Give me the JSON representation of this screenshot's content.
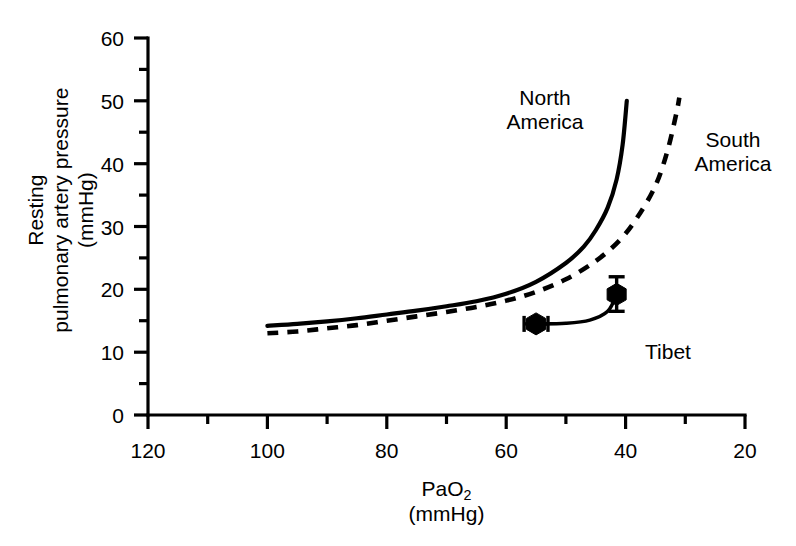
{
  "chart_data": {
    "type": "line",
    "title": "",
    "xlabel": "PaO2 (mmHg)",
    "ylabel": "Resting pulmonary artery pressure (mmHg)",
    "xlim": [
      120,
      20
    ],
    "ylim": [
      0,
      60
    ],
    "x_axis_reversed": true,
    "grid": false,
    "legend_position": "inline-annotations",
    "xticks": [
      120,
      100,
      80,
      60,
      40,
      20
    ],
    "xticks_minor": [
      110,
      90,
      70,
      50,
      30
    ],
    "yticks": [
      0,
      10,
      20,
      30,
      40,
      50,
      60
    ],
    "yticks_minor": [
      5,
      15,
      25,
      35,
      45,
      55
    ],
    "series": [
      {
        "name": "North America",
        "style": "solid",
        "color": "#000000",
        "points": [
          [
            100,
            14.2
          ],
          [
            95,
            14.5
          ],
          [
            90,
            14.9
          ],
          [
            85,
            15.4
          ],
          [
            80,
            16.0
          ],
          [
            75,
            16.6
          ],
          [
            70,
            17.3
          ],
          [
            65,
            18.1
          ],
          [
            60,
            19.3
          ],
          [
            55,
            21.2
          ],
          [
            50,
            24.2
          ],
          [
            47,
            26.8
          ],
          [
            45,
            29.4
          ],
          [
            43,
            33.0
          ],
          [
            41.5,
            37.5
          ],
          [
            40.5,
            43.0
          ],
          [
            39.8,
            50.0
          ]
        ]
      },
      {
        "name": "South America",
        "style": "dashed",
        "color": "#000000",
        "points": [
          [
            100,
            13.0
          ],
          [
            95,
            13.3
          ],
          [
            90,
            13.8
          ],
          [
            85,
            14.3
          ],
          [
            80,
            15.0
          ],
          [
            75,
            15.7
          ],
          [
            70,
            16.4
          ],
          [
            65,
            17.2
          ],
          [
            60,
            18.2
          ],
          [
            55,
            19.6
          ],
          [
            50,
            21.6
          ],
          [
            45,
            24.5
          ],
          [
            41,
            27.8
          ],
          [
            38,
            31.5
          ],
          [
            35,
            36.5
          ],
          [
            33,
            42.0
          ],
          [
            31.5,
            48.0
          ],
          [
            31,
            50.5
          ]
        ]
      },
      {
        "name": "Tibet",
        "style": "solid",
        "color": "#000000",
        "points": [
          [
            55,
            14.5
          ],
          [
            50,
            14.6
          ],
          [
            46,
            15.1
          ],
          [
            43,
            16.5
          ],
          [
            41.5,
            19.2
          ]
        ],
        "markers": [
          {
            "label": "Tibet low altitude",
            "x": 55,
            "y": 14.5,
            "shape": "hexagon",
            "error_bar": "horizontal",
            "error_low": 53.0,
            "error_high": 57.0
          },
          {
            "label": "Tibet high altitude",
            "x": 41.5,
            "y": 19.2,
            "shape": "hexagon",
            "error_bar": "vertical",
            "error_low": 16.5,
            "error_high": 22.0
          }
        ]
      }
    ],
    "annotations": [
      {
        "text_line1": "North",
        "text_line2": "America",
        "x": 52,
        "y": 52
      },
      {
        "text_line1": "South",
        "text_line2": "America",
        "x": 26,
        "y": 45
      },
      {
        "text_line1": "Tibet",
        "text_line2": "",
        "x": 36,
        "y": 11
      }
    ]
  },
  "axes": {
    "y_title_line1": "Resting",
    "y_title_line2": "pulmonary artery pressure",
    "y_title_line3": "(mmHg)",
    "x_title_main": "PaO",
    "x_title_sub": "2",
    "x_title_units": "(mmHg)",
    "y_tick_labels": [
      "60",
      "50",
      "40",
      "30",
      "20",
      "10",
      "0"
    ],
    "x_tick_labels": [
      "120",
      "100",
      "80",
      "60",
      "40",
      "20"
    ]
  },
  "annotations": {
    "north_america_line1": "North",
    "north_america_line2": "America",
    "south_america_line1": "South",
    "south_america_line2": "America",
    "tibet": "Tibet"
  },
  "colors": {
    "ink": "#000000",
    "background": "#ffffff"
  }
}
